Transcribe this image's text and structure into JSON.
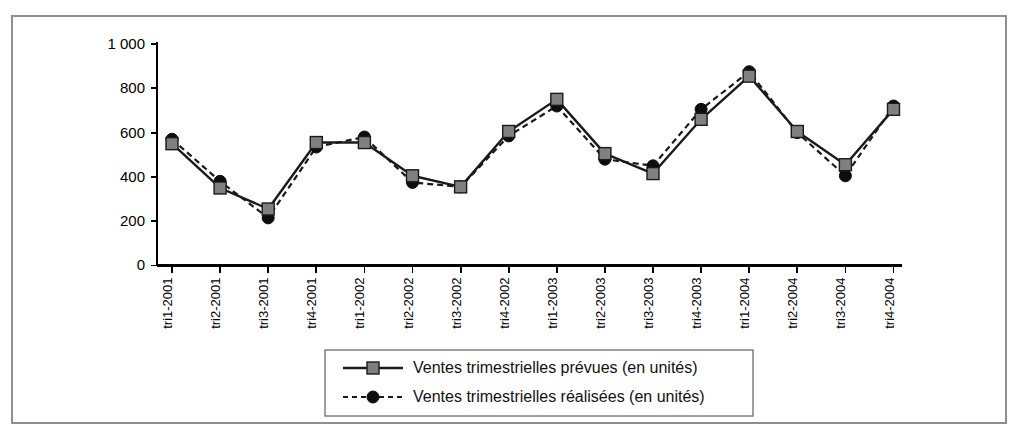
{
  "chart_data": {
    "type": "line",
    "title": "",
    "subtitle": "",
    "xlabel": "",
    "ylabel": "",
    "ylim": [
      0,
      1000
    ],
    "ytick_labels": [
      "0",
      "200",
      "400",
      "600",
      "800",
      "1 000"
    ],
    "ytick_values": [
      0,
      200,
      400,
      600,
      800,
      1000
    ],
    "grid": false,
    "legend_position": "bottom-center",
    "categories": [
      "tri1-2001",
      "tri2-2001",
      "tri3-2001",
      "tri4-2001",
      "tri1-2002",
      "tri2-2002",
      "tri3-2002",
      "tri4-2002",
      "tri1-2003",
      "tri2-2003",
      "tri3-2003",
      "tri4-2003",
      "tri1-2004",
      "tri2-2004",
      "tri3-2004",
      "tri4-2004"
    ],
    "series": [
      {
        "name": "Ventes trimestrielles prévues (en unités)",
        "marker": "square",
        "marker_color": "#808080",
        "line_style": "solid",
        "line_color": "#1a1a1a",
        "values": [
          550,
          350,
          255,
          555,
          555,
          405,
          355,
          605,
          750,
          505,
          415,
          660,
          855,
          605,
          455,
          705
        ]
      },
      {
        "name": "Ventes trimestrielles réalisées (en unités)",
        "marker": "circle",
        "marker_color": "#0d0d0d",
        "line_style": "dashed",
        "line_color": "#1a1a1a",
        "values": [
          570,
          380,
          215,
          535,
          580,
          375,
          355,
          585,
          720,
          480,
          450,
          705,
          875,
          600,
          405,
          720
        ]
      }
    ]
  },
  "legend": {
    "items": [
      {
        "label": "Ventes trimestrielles prévues (en unités)"
      },
      {
        "label": "Ventes trimestrielles réalisées (en unités)"
      }
    ]
  },
  "colors": {
    "frame": "#8f8f8f",
    "axis": "#000000",
    "series_prevues_marker": "#808080",
    "series_realisees_marker": "#0d0d0d",
    "background": "#ffffff"
  }
}
